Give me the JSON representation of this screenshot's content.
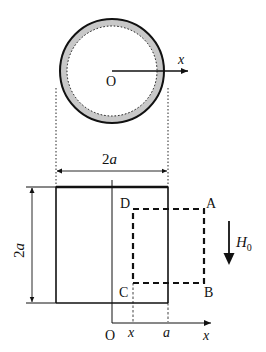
{
  "figure": {
    "top_view": {
      "center_label": "O",
      "axis_label": "x"
    },
    "width_dimension": {
      "label": "2a",
      "label_base": "2",
      "label_var": "a"
    },
    "height_dimension": {
      "label": "2a",
      "label_base": "2",
      "label_var": "a"
    },
    "loop_corners": {
      "A": "A",
      "B": "B",
      "C": "C",
      "D": "D"
    },
    "field": {
      "label": "H0",
      "symbol": "H",
      "subscript": "0"
    },
    "bottom_axis": {
      "origin": "O",
      "tick_x": "x",
      "tick_a": "a",
      "axis_label": "x"
    },
    "colors": {
      "line": "#111111",
      "ring_fill": "#c8c8c8",
      "background": "#ffffff"
    }
  }
}
